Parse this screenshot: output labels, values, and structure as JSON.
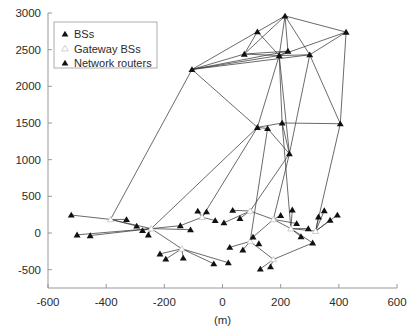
{
  "chart_data": {
    "type": "scatter",
    "title": "",
    "xlabel": "(m)",
    "ylabel": "",
    "xlim": [
      -600,
      600
    ],
    "ylim": [
      -750,
      3000
    ],
    "xticks": [
      -600,
      -400,
      -200,
      0,
      200,
      400,
      600
    ],
    "xticklabels": [
      "-600",
      "-400",
      "-200",
      "0",
      "200",
      "400",
      "600"
    ],
    "yticks": [
      -500,
      0,
      500,
      1000,
      1500,
      2000,
      2500,
      3000
    ],
    "yticklabels": [
      "-500",
      "0",
      "500",
      "1000",
      "1500",
      "2000",
      "2500",
      "3000"
    ],
    "grid": false,
    "legend_position": "upper-left",
    "legend": [
      {
        "key": "bs",
        "label": "BSs",
        "marker": "filled-triangle",
        "color": "#111111"
      },
      {
        "key": "gateway",
        "label": "Gateway BSs",
        "marker": "open-triangle",
        "color": "#ffffff"
      },
      {
        "key": "router",
        "label": "Network routers",
        "marker": "filled-triangle",
        "color": "#111111"
      }
    ],
    "series": [
      {
        "name": "Network routers",
        "marker": "filled-triangle",
        "points": [
          [
            215,
            2960
          ],
          [
            120,
            2745
          ],
          [
            -105,
            2230
          ],
          [
            225,
            2480
          ],
          [
            75,
            2440
          ],
          [
            195,
            2420
          ],
          [
            425,
            2740
          ],
          [
            300,
            2430
          ],
          [
            120,
            1440
          ],
          [
            205,
            1500
          ],
          [
            405,
            1490
          ],
          [
            230,
            1080
          ],
          [
            155,
            1425
          ]
        ]
      },
      {
        "name": "Gateway BSs",
        "marker": "open-triangle",
        "points": [
          [
            -385,
            185
          ],
          [
            -245,
            60
          ],
          [
            -140,
            -215
          ],
          [
            95,
            300
          ],
          [
            175,
            185
          ],
          [
            235,
            60
          ],
          [
            95,
            -115
          ],
          [
            -70,
            215
          ],
          [
            175,
            -360
          ],
          [
            320,
            25
          ]
        ]
      },
      {
        "name": "BSs",
        "marker": "filled-triangle",
        "points": [
          [
            -520,
            245
          ],
          [
            -500,
            -25
          ],
          [
            -455,
            -35
          ],
          [
            -330,
            185
          ],
          [
            -295,
            95
          ],
          [
            -275,
            35
          ],
          [
            -255,
            -25
          ],
          [
            -215,
            -285
          ],
          [
            -195,
            -355
          ],
          [
            -135,
            -340
          ],
          [
            -85,
            300
          ],
          [
            -55,
            290
          ],
          [
            -25,
            170
          ],
          [
            5,
            140
          ],
          [
            35,
            310
          ],
          [
            60,
            200
          ],
          [
            105,
            -55
          ],
          [
            125,
            -145
          ],
          [
            130,
            -490
          ],
          [
            165,
            -460
          ],
          [
            200,
            240
          ],
          [
            240,
            315
          ],
          [
            255,
            130
          ],
          [
            270,
            -50
          ],
          [
            295,
            60
          ],
          [
            310,
            -135
          ],
          [
            330,
            220
          ],
          [
            350,
            305
          ],
          [
            370,
            175
          ],
          [
            395,
            245
          ],
          [
            -145,
            100
          ],
          [
            -110,
            45
          ],
          [
            25,
            -195
          ],
          [
            70,
            -230
          ],
          [
            -30,
            -420
          ],
          [
            20,
            -405
          ]
        ]
      }
    ],
    "edges": [
      [
        [
          215,
          2960
        ],
        [
          120,
          2745
        ]
      ],
      [
        [
          215,
          2960
        ],
        [
          425,
          2740
        ]
      ],
      [
        [
          215,
          2960
        ],
        [
          225,
          2480
        ]
      ],
      [
        [
          215,
          2960
        ],
        [
          195,
          2420
        ]
      ],
      [
        [
          215,
          2960
        ],
        [
          75,
          2440
        ]
      ],
      [
        [
          215,
          2960
        ],
        [
          300,
          2430
        ]
      ],
      [
        [
          120,
          2745
        ],
        [
          -105,
          2230
        ]
      ],
      [
        [
          120,
          2745
        ],
        [
          195,
          2420
        ]
      ],
      [
        [
          120,
          2745
        ],
        [
          75,
          2440
        ]
      ],
      [
        [
          425,
          2740
        ],
        [
          195,
          2420
        ]
      ],
      [
        [
          425,
          2740
        ],
        [
          300,
          2430
        ]
      ],
      [
        [
          425,
          2740
        ],
        [
          405,
          1490
        ]
      ],
      [
        [
          -105,
          2230
        ],
        [
          75,
          2440
        ]
      ],
      [
        [
          -105,
          2230
        ],
        [
          195,
          2420
        ]
      ],
      [
        [
          -105,
          2230
        ],
        [
          225,
          2480
        ]
      ],
      [
        [
          -105,
          2230
        ],
        [
          300,
          2430
        ]
      ],
      [
        [
          -105,
          2230
        ],
        [
          120,
          1440
        ]
      ],
      [
        [
          -105,
          2230
        ],
        [
          -385,
          185
        ]
      ],
      [
        [
          75,
          2440
        ],
        [
          195,
          2420
        ]
      ],
      [
        [
          75,
          2440
        ],
        [
          225,
          2480
        ]
      ],
      [
        [
          225,
          2480
        ],
        [
          195,
          2420
        ]
      ],
      [
        [
          195,
          2420
        ],
        [
          300,
          2430
        ]
      ],
      [
        [
          195,
          2420
        ],
        [
          120,
          1440
        ]
      ],
      [
        [
          195,
          2420
        ],
        [
          205,
          1500
        ]
      ],
      [
        [
          195,
          2420
        ],
        [
          230,
          1080
        ]
      ],
      [
        [
          300,
          2430
        ],
        [
          405,
          1490
        ]
      ],
      [
        [
          300,
          2430
        ],
        [
          230,
          1080
        ]
      ],
      [
        [
          120,
          1440
        ],
        [
          205,
          1500
        ]
      ],
      [
        [
          120,
          1440
        ],
        [
          155,
          1425
        ]
      ],
      [
        [
          155,
          1425
        ],
        [
          230,
          1080
        ]
      ],
      [
        [
          205,
          1500
        ],
        [
          405,
          1490
        ]
      ],
      [
        [
          205,
          1500
        ],
        [
          230,
          1080
        ]
      ],
      [
        [
          230,
          1080
        ],
        [
          95,
          300
        ]
      ],
      [
        [
          230,
          1080
        ],
        [
          175,
          185
        ]
      ],
      [
        [
          120,
          1440
        ],
        [
          -70,
          215
        ]
      ],
      [
        [
          155,
          1425
        ],
        [
          95,
          -115
        ]
      ],
      [
        [
          405,
          1490
        ],
        [
          320,
          25
        ]
      ],
      [
        [
          205,
          1500
        ],
        [
          235,
          60
        ]
      ],
      [
        [
          120,
          1440
        ],
        [
          -245,
          60
        ]
      ],
      [
        [
          -385,
          185
        ],
        [
          -520,
          245
        ]
      ],
      [
        [
          -385,
          185
        ],
        [
          -330,
          185
        ]
      ],
      [
        [
          -385,
          185
        ],
        [
          -295,
          95
        ]
      ],
      [
        [
          -385,
          185
        ],
        [
          -245,
          60
        ]
      ],
      [
        [
          -245,
          60
        ],
        [
          -500,
          -25
        ]
      ],
      [
        [
          -245,
          60
        ],
        [
          -455,
          -35
        ]
      ],
      [
        [
          -245,
          60
        ],
        [
          -145,
          100
        ]
      ],
      [
        [
          -245,
          60
        ],
        [
          -275,
          35
        ]
      ],
      [
        [
          -245,
          60
        ],
        [
          -255,
          -25
        ]
      ],
      [
        [
          -245,
          60
        ],
        [
          -140,
          -215
        ]
      ],
      [
        [
          -245,
          60
        ],
        [
          -110,
          45
        ]
      ],
      [
        [
          -140,
          -215
        ],
        [
          -215,
          -285
        ]
      ],
      [
        [
          -140,
          -215
        ],
        [
          -195,
          -355
        ]
      ],
      [
        [
          -140,
          -215
        ],
        [
          -135,
          -340
        ]
      ],
      [
        [
          -140,
          -215
        ],
        [
          -30,
          -420
        ]
      ],
      [
        [
          -140,
          -215
        ],
        [
          20,
          -405
        ]
      ],
      [
        [
          -70,
          215
        ],
        [
          -85,
          300
        ]
      ],
      [
        [
          -70,
          215
        ],
        [
          -55,
          290
        ]
      ],
      [
        [
          -70,
          215
        ],
        [
          -25,
          170
        ]
      ],
      [
        [
          -70,
          215
        ],
        [
          -145,
          100
        ]
      ],
      [
        [
          95,
          300
        ],
        [
          35,
          310
        ]
      ],
      [
        [
          95,
          300
        ],
        [
          5,
          140
        ]
      ],
      [
        [
          95,
          300
        ],
        [
          60,
          200
        ]
      ],
      [
        [
          95,
          300
        ],
        [
          175,
          185
        ]
      ],
      [
        [
          175,
          185
        ],
        [
          200,
          240
        ]
      ],
      [
        [
          175,
          185
        ],
        [
          255,
          130
        ]
      ],
      [
        [
          175,
          185
        ],
        [
          105,
          -55
        ]
      ],
      [
        [
          175,
          185
        ],
        [
          235,
          60
        ]
      ],
      [
        [
          235,
          60
        ],
        [
          240,
          315
        ]
      ],
      [
        [
          235,
          60
        ],
        [
          270,
          -50
        ]
      ],
      [
        [
          235,
          60
        ],
        [
          295,
          60
        ]
      ],
      [
        [
          235,
          60
        ],
        [
          310,
          -135
        ]
      ],
      [
        [
          235,
          60
        ],
        [
          320,
          25
        ]
      ],
      [
        [
          320,
          25
        ],
        [
          330,
          220
        ]
      ],
      [
        [
          320,
          25
        ],
        [
          350,
          305
        ]
      ],
      [
        [
          320,
          25
        ],
        [
          370,
          175
        ]
      ],
      [
        [
          320,
          25
        ],
        [
          395,
          245
        ]
      ],
      [
        [
          95,
          -115
        ],
        [
          25,
          -195
        ]
      ],
      [
        [
          95,
          -115
        ],
        [
          70,
          -230
        ]
      ],
      [
        [
          95,
          -115
        ],
        [
          105,
          -55
        ]
      ],
      [
        [
          95,
          -115
        ],
        [
          175,
          -360
        ]
      ],
      [
        [
          175,
          -360
        ],
        [
          130,
          -490
        ]
      ],
      [
        [
          175,
          -360
        ],
        [
          165,
          -460
        ]
      ],
      [
        [
          175,
          -360
        ],
        [
          310,
          -135
        ]
      ]
    ]
  }
}
